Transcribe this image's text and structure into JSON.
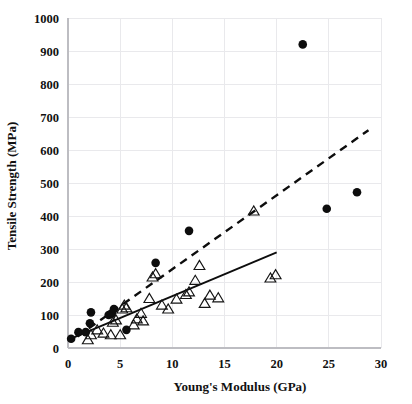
{
  "chart_data": {
    "type": "scatter",
    "title": "",
    "xlabel": "Young's Modulus (GPa)",
    "ylabel": "Tensile Strength (MPa)",
    "xlim": [
      0,
      30
    ],
    "ylim": [
      0,
      1000
    ],
    "xticks": [
      0,
      5,
      10,
      15,
      20,
      25,
      30
    ],
    "yticks": [
      0,
      100,
      200,
      300,
      400,
      500,
      600,
      700,
      800,
      900,
      1000
    ],
    "xtick_labels": [
      "0",
      "5",
      "10",
      "15",
      "20",
      "25",
      "30"
    ],
    "ytick_labels": [
      "0",
      "100",
      "200",
      "300",
      "400",
      "500",
      "600",
      "700",
      "800",
      "900",
      "1000"
    ],
    "grid": true,
    "legend": null,
    "series": [
      {
        "name": "filled-circle-series",
        "marker": "circle",
        "filled": true,
        "color": "#0d0d0d",
        "points": [
          [
            0.3,
            28
          ],
          [
            1.0,
            48
          ],
          [
            1.7,
            48
          ],
          [
            2.1,
            75
          ],
          [
            2.2,
            108
          ],
          [
            3.9,
            100
          ],
          [
            4.2,
            105
          ],
          [
            4.4,
            118
          ],
          [
            5.6,
            55
          ],
          [
            8.4,
            258
          ],
          [
            11.6,
            355
          ],
          [
            22.5,
            920
          ],
          [
            24.8,
            422
          ],
          [
            27.7,
            472
          ]
        ]
      },
      {
        "name": "open-triangle-series",
        "marker": "triangle",
        "filled": false,
        "color": "#141414",
        "points": [
          [
            1.9,
            25
          ],
          [
            2.2,
            40
          ],
          [
            2.8,
            55
          ],
          [
            3.4,
            45
          ],
          [
            4.1,
            40
          ],
          [
            4.3,
            78
          ],
          [
            4.6,
            85
          ],
          [
            5.0,
            40
          ],
          [
            5.2,
            118
          ],
          [
            5.4,
            130
          ],
          [
            5.6,
            122
          ],
          [
            6.3,
            70
          ],
          [
            6.6,
            88
          ],
          [
            7.0,
            105
          ],
          [
            7.2,
            82
          ],
          [
            7.8,
            150
          ],
          [
            8.1,
            215
          ],
          [
            8.4,
            225
          ],
          [
            9.0,
            130
          ],
          [
            9.6,
            118
          ],
          [
            10.4,
            148
          ],
          [
            11.3,
            162
          ],
          [
            11.6,
            170
          ],
          [
            12.2,
            205
          ],
          [
            12.6,
            250
          ],
          [
            13.1,
            135
          ],
          [
            13.6,
            160
          ],
          [
            14.4,
            152
          ],
          [
            17.8,
            415
          ],
          [
            19.4,
            212
          ],
          [
            19.9,
            222
          ]
        ]
      }
    ],
    "trendlines": [
      {
        "name": "solid-trendline",
        "style": "solid",
        "color": "#0d0d0d",
        "x0": 0.4,
        "y0": 30,
        "x1": 20.0,
        "y1": 290
      },
      {
        "name": "dashed-trendline",
        "style": "dashed",
        "color": "#0d0d0d",
        "x0": 0.9,
        "y0": 35,
        "x1": 28.8,
        "y1": 660
      }
    ]
  }
}
